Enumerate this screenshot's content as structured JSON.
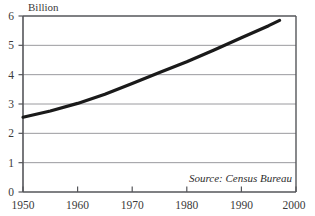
{
  "chart_data": {
    "type": "line",
    "title": "",
    "subtitle": "",
    "ylabel": "Billion",
    "xlabel": "",
    "xlim": [
      1950,
      2000
    ],
    "ylim": [
      0,
      6
    ],
    "grid": true,
    "legend": null,
    "annotations": [
      {
        "name": "source-note",
        "text": "Source: Census Bureau"
      }
    ],
    "x_ticks": [
      {
        "value": 1950,
        "label": "1950"
      },
      {
        "value": 1960,
        "label": "1960"
      },
      {
        "value": 1970,
        "label": "1970"
      },
      {
        "value": 1980,
        "label": "1980"
      },
      {
        "value": 1990,
        "label": "1990"
      },
      {
        "value": 2000,
        "label": "2000"
      }
    ],
    "y_ticks": [
      {
        "value": 0,
        "label": "0"
      },
      {
        "value": 1,
        "label": "1"
      },
      {
        "value": 2,
        "label": "2"
      },
      {
        "value": 3,
        "label": "3"
      },
      {
        "value": 4,
        "label": "4"
      },
      {
        "value": 5,
        "label": "5"
      },
      {
        "value": 6,
        "label": "6"
      }
    ],
    "series": [
      {
        "name": "World Population",
        "color": "#1a1a1a",
        "line_width": 3.2,
        "x": [
          1950,
          1955,
          1960,
          1965,
          1970,
          1975,
          1980,
          1985,
          1990,
          1995,
          1997
        ],
        "values": [
          2.55,
          2.76,
          3.02,
          3.33,
          3.7,
          4.07,
          4.44,
          4.84,
          5.26,
          5.67,
          5.85
        ]
      }
    ]
  },
  "colors": {
    "frame": "#55565a",
    "grid": "#9a9a9e",
    "series": "#1a1a1a",
    "text": "#3a3a3a",
    "background": "#ffffff"
  }
}
